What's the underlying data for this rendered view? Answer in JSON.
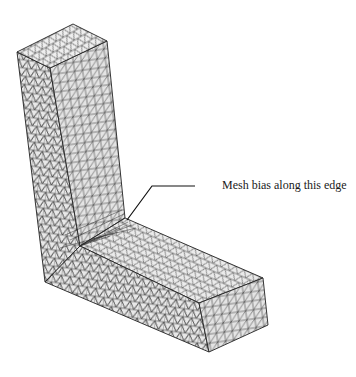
{
  "figure": {
    "annotation": {
      "text": "Mesh bias along this edge",
      "leader_line": [
        [
          152,
          186
        ],
        [
          195,
          186
        ],
        [
          152,
          186
        ],
        [
          127,
          220
        ]
      ]
    }
  },
  "colors": {
    "background": "#ffffff",
    "face_fill": "#e6e6e6",
    "face_fill_light": "#efefef",
    "mesh_line": "#3a3a3a",
    "edge_line": "#222222",
    "text": "#1a1a1a"
  }
}
